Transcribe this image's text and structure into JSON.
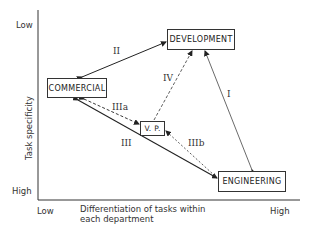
{
  "diagram": {
    "y_axis": {
      "label": "Task specificity",
      "top": "Low",
      "bottom": "High"
    },
    "x_axis": {
      "label_line1": "Differentiation of tasks within",
      "label_line2": "each department",
      "left": "Low",
      "right": "High"
    },
    "nodes": {
      "commercial": "COMMERCIAL",
      "development": "DEVELOPMENT",
      "vp": "V. P.",
      "engineering": "ENGINEERING"
    },
    "edges": {
      "I": "I",
      "II": "II",
      "III": "III",
      "IIIa": "IIIa",
      "IIIb": "IIIb",
      "IV": "IV"
    },
    "edge_styles": {
      "I": "solid, Engineering <-> Development",
      "II": "solid, Commercial <-> Development",
      "III": "solid, Commercial <-> Engineering",
      "IIIa": "dashed, Commercial -> V.P.",
      "IIIb": "dashed, Engineering -> V.P.",
      "IV": "dashed, V.P. -> Development"
    }
  }
}
